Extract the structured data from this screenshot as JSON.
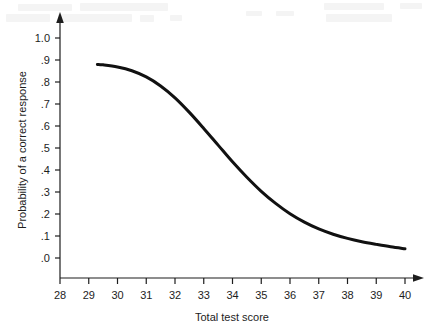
{
  "chart_data": {
    "type": "line",
    "title": "",
    "xlabel": "Total test score",
    "ylabel": "Probability of a correct response",
    "xlim": [
      28,
      40
    ],
    "ylim": [
      0.0,
      1.0
    ],
    "grid": false,
    "legend": "none",
    "xticks": [
      "28",
      "29",
      "30",
      "31",
      "32",
      "33",
      "34",
      "35",
      "36",
      "37",
      "38",
      "39",
      "40"
    ],
    "xtick_values": [
      28,
      29,
      30,
      31,
      32,
      33,
      34,
      35,
      36,
      37,
      38,
      39,
      40
    ],
    "yticks": [
      "1.0",
      ".9",
      ".8",
      ".7",
      ".6",
      ".5",
      ".4",
      ".3",
      ".2",
      ".1",
      ".0"
    ],
    "ytick_values": [
      1.0,
      0.9,
      0.8,
      0.7,
      0.6,
      0.5,
      0.4,
      0.3,
      0.2,
      0.1,
      0.0
    ],
    "series": [
      {
        "name": "Item characteristic curve",
        "color": "#111111",
        "line_width": 3,
        "x": [
          29.3,
          29.5,
          30.0,
          30.5,
          31.0,
          31.5,
          32.0,
          32.5,
          33.0,
          33.5,
          34.0,
          34.5,
          35.0,
          35.5,
          36.0,
          36.5,
          37.0,
          37.5,
          38.0,
          38.5,
          39.0,
          39.5,
          40.0
        ],
        "values": [
          0.88,
          0.878,
          0.868,
          0.851,
          0.823,
          0.782,
          0.728,
          0.662,
          0.589,
          0.513,
          0.437,
          0.367,
          0.303,
          0.248,
          0.201,
          0.163,
          0.132,
          0.108,
          0.089,
          0.074,
          0.062,
          0.051,
          0.042
        ]
      }
    ],
    "annotations": []
  },
  "axes": {
    "y_axis_label": "Probability of a correct response",
    "x_axis_label": "Total test score"
  }
}
